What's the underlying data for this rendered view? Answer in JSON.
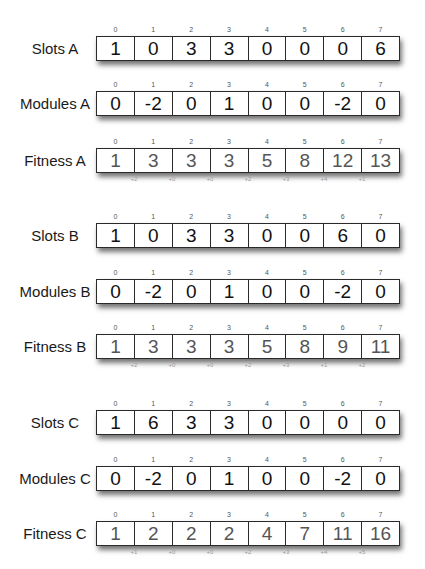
{
  "index_labels": [
    "0",
    "1",
    "2",
    "3",
    "4",
    "5",
    "6",
    "7"
  ],
  "groups": [
    {
      "id": "A",
      "slots": {
        "label": "Slots A",
        "values": [
          "1",
          "0",
          "3",
          "3",
          "0",
          "0",
          "0",
          "6"
        ]
      },
      "modules": {
        "label": "Modules A",
        "values": [
          "0",
          "-2",
          "0",
          "1",
          "0",
          "0",
          "-2",
          "0"
        ]
      },
      "fitness": {
        "label": "Fitness A",
        "values": [
          "1",
          "3",
          "3",
          "3",
          "5",
          "8",
          "12",
          "13"
        ],
        "deltas": [
          "+2",
          "+0",
          "+0",
          "+2",
          "+3",
          "+4",
          "+1"
        ]
      }
    },
    {
      "id": "B",
      "slots": {
        "label": "Slots B",
        "values": [
          "1",
          "0",
          "3",
          "3",
          "0",
          "0",
          "6",
          "0"
        ]
      },
      "modules": {
        "label": "Modules B",
        "values": [
          "0",
          "-2",
          "0",
          "1",
          "0",
          "0",
          "-2",
          "0"
        ]
      },
      "fitness": {
        "label": "Fitness B",
        "values": [
          "1",
          "3",
          "3",
          "3",
          "5",
          "8",
          "9",
          "11"
        ],
        "deltas": [
          "+2",
          "+0",
          "+0",
          "+2",
          "+3",
          "+1",
          "+2"
        ]
      }
    },
    {
      "id": "C",
      "slots": {
        "label": "Slots C",
        "values": [
          "1",
          "6",
          "3",
          "3",
          "0",
          "0",
          "0",
          "0"
        ]
      },
      "modules": {
        "label": "Modules C",
        "values": [
          "0",
          "-2",
          "0",
          "1",
          "0",
          "0",
          "-2",
          "0"
        ]
      },
      "fitness": {
        "label": "Fitness C",
        "values": [
          "1",
          "2",
          "2",
          "2",
          "4",
          "7",
          "11",
          "16"
        ],
        "deltas": [
          "+1",
          "+0",
          "+0",
          "+2",
          "+3",
          "+4",
          "+5"
        ]
      }
    }
  ],
  "colors": {
    "border": "#2a2a2a",
    "value_text": "#111111",
    "fitness_text": "#555555",
    "index_text": "#555555",
    "delta_text": "#9a9a9a"
  }
}
